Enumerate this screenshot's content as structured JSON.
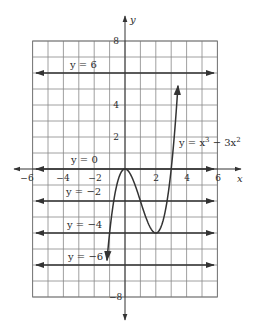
{
  "chart_data": {
    "type": "line",
    "title": "",
    "xlabel": "x",
    "ylabel": "y",
    "xlim": [
      -6,
      6
    ],
    "ylim": [
      -8,
      8
    ],
    "grid": true,
    "grid_step": 1,
    "x_tick_labels": [
      "-6",
      "-4",
      "-2",
      "2",
      "4",
      "6"
    ],
    "x_ticks": [
      -6,
      -4,
      -2,
      2,
      4,
      6
    ],
    "y_tick_labels": [
      "8",
      "4",
      "2",
      "-8"
    ],
    "y_ticks": [
      8,
      4,
      2,
      -8
    ],
    "series": [
      {
        "name": "y = x^3 - 3x^2",
        "label": "y = x³ − 3x²",
        "function": "x^3 - 3x^2",
        "x_range": [
          -1.17,
          3.44
        ],
        "key_points": [
          {
            "x": 0,
            "y": 0,
            "note": "local maximum"
          },
          {
            "x": 2,
            "y": -4,
            "note": "local minimum"
          },
          {
            "x": 3,
            "y": 0,
            "note": "x-intercept"
          }
        ]
      },
      {
        "name": "y = 6",
        "label": "y = 6",
        "type": "horizontal",
        "value": 6
      },
      {
        "name": "y = 0",
        "label": "y = 0",
        "type": "horizontal",
        "value": 0
      },
      {
        "name": "y = -2",
        "label": "y = −2",
        "type": "horizontal",
        "value": -2
      },
      {
        "name": "y = -4",
        "label": "y = −4",
        "type": "horizontal",
        "value": -4
      },
      {
        "name": "y = -6",
        "label": "y = −6",
        "type": "horizontal",
        "value": -6
      }
    ]
  },
  "labels": {
    "axis_x": "x",
    "axis_y": "y",
    "tick_x_m6": "−6",
    "tick_x_m4": "−4",
    "tick_x_m2": "−2",
    "tick_x_2": "2",
    "tick_x_4": "4",
    "tick_x_6": "6",
    "tick_y_8": "8",
    "tick_y_4": "4",
    "tick_y_2": "2",
    "tick_y_m8": "−8",
    "line_y6": "y = 6",
    "line_y0": "y = 0",
    "line_ym2": "y = −2",
    "line_ym4": "y = −4",
    "line_ym6": "y = −6",
    "curve_prefix": "y = x",
    "curve_exp1": "3",
    "curve_mid": " − 3x",
    "curve_exp2": "2"
  }
}
